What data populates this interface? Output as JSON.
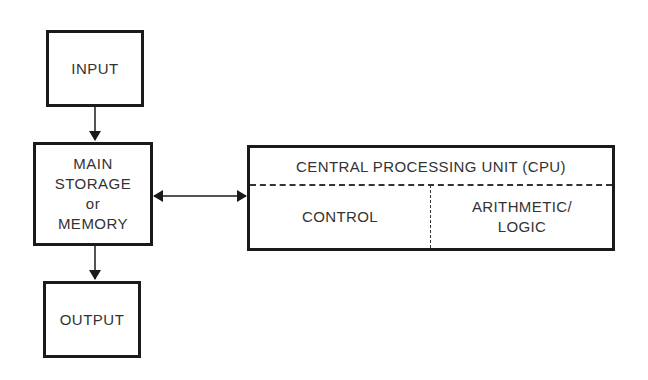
{
  "diagram": {
    "nodes": {
      "input": {
        "label": "INPUT"
      },
      "memory": {
        "line1": "MAIN",
        "line2": "STORAGE",
        "line3": "or",
        "line4": "MEMORY"
      },
      "output": {
        "label": "OUTPUT"
      },
      "cpu": {
        "title": "CENTRAL PROCESSING UNIT (CPU)",
        "control": "CONTROL",
        "alu_line1": "ARITHMETIC/",
        "alu_line2": "LOGIC"
      }
    },
    "edges": [
      {
        "from": "input",
        "to": "memory",
        "type": "arrow"
      },
      {
        "from": "memory",
        "to": "output",
        "type": "arrow"
      },
      {
        "from": "memory",
        "to": "cpu",
        "type": "bidirectional-arrow"
      }
    ],
    "colors": {
      "stroke": "#1a1a1a",
      "text": "#333333",
      "background": "#ffffff"
    }
  }
}
